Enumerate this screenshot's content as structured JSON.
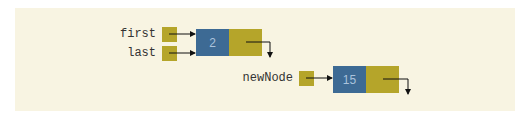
{
  "diagram": {
    "type": "linked-list",
    "colors": {
      "background": "#f8f4e2",
      "pointer_box": "#b5a52a",
      "data_box": "#3d6a94",
      "data_text": "#aac3dc",
      "arrow": "#111111"
    },
    "pointers": [
      {
        "name": "first",
        "label": "first",
        "points_to": "node-1"
      },
      {
        "name": "last",
        "label": "last",
        "points_to": "node-1"
      },
      {
        "name": "newNode",
        "label": "newNode",
        "points_to": "node-2"
      }
    ],
    "nodes": [
      {
        "id": "node-1",
        "info": "2",
        "link": "null"
      },
      {
        "id": "node-2",
        "info": "15",
        "link": "null"
      }
    ]
  }
}
